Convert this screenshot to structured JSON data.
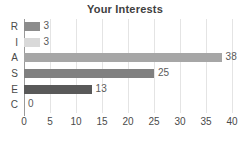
{
  "chart_data": {
    "type": "bar",
    "orientation": "horizontal",
    "title": "Your Interests",
    "xlabel": "",
    "ylabel": "",
    "categories": [
      "R",
      "I",
      "A",
      "S",
      "E",
      "C"
    ],
    "values": [
      3,
      3,
      38,
      25,
      13,
      0
    ],
    "value_labels": [
      "3",
      "3",
      "38",
      "25",
      "13",
      "0"
    ],
    "bar_colors": [
      "#8c8c8c",
      "#d9d9d9",
      "#a6a6a6",
      "#808080",
      "#595959",
      "#bfbfbf"
    ],
    "xlim": [
      0,
      40
    ],
    "xticks": [
      0,
      5,
      10,
      15,
      20,
      25,
      30,
      35,
      40
    ],
    "xtick_labels": [
      "0",
      "5",
      "10",
      "15",
      "20",
      "25",
      "30",
      "35",
      "40"
    ],
    "grid": true,
    "grid_axis": "x",
    "legend": false,
    "legend_position": "none"
  },
  "colors": {
    "background": "#ffffff",
    "title_text": "#404040",
    "tick_text": "#4a4a4a",
    "value_text": "#5a5a5a",
    "gridline": "#e4e4e4",
    "axis_line": "#9a9a9a"
  }
}
